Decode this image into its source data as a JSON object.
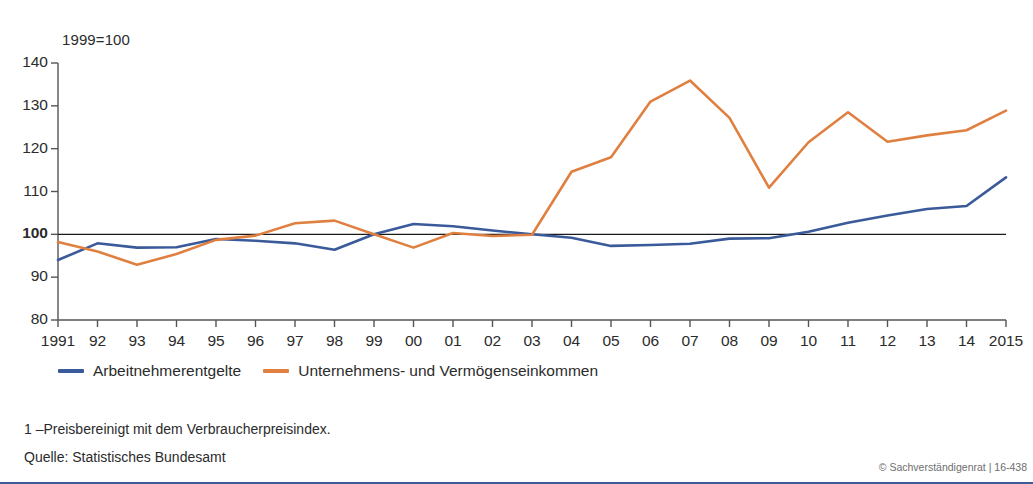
{
  "chart_data": {
    "type": "line",
    "title": "",
    "subtitle": "",
    "axis_unit_label": "1999=100",
    "xlabel": "",
    "ylabel": "",
    "grid": false,
    "legend_position": "bottom-left",
    "xlim": [
      1991,
      2015
    ],
    "ylim": [
      80,
      140
    ],
    "ytick_values": [
      80,
      90,
      100,
      110,
      120,
      130,
      140
    ],
    "ytick_labels": [
      "80",
      "90",
      "100",
      "110",
      "120",
      "130",
      "140"
    ],
    "emphasized_ytick": "100",
    "x": [
      1991,
      1992,
      1993,
      1994,
      1995,
      1996,
      1997,
      1998,
      1999,
      2000,
      2001,
      2002,
      2003,
      2004,
      2005,
      2006,
      2007,
      2008,
      2009,
      2010,
      2011,
      2012,
      2013,
      2014,
      2015
    ],
    "categories": [
      "1991",
      "92",
      "93",
      "94",
      "95",
      "96",
      "97",
      "98",
      "99",
      "00",
      "01",
      "02",
      "03",
      "04",
      "05",
      "06",
      "07",
      "08",
      "09",
      "10",
      "11",
      "12",
      "13",
      "14",
      "2015"
    ],
    "series": [
      {
        "name": "Arbeitnehmerentgelte",
        "color": "#3a5a9a",
        "values": [
          94.0,
          97.9,
          96.9,
          97.0,
          98.9,
          98.5,
          97.9,
          96.4,
          100.0,
          102.4,
          101.9,
          100.9,
          100.0,
          99.2,
          97.3,
          97.5,
          97.8,
          99.0,
          99.1,
          100.6,
          102.7,
          104.4,
          105.9,
          106.6,
          113.3
        ]
      },
      {
        "name": "Unternehmens- und Vermögenseinkommen",
        "color": "#e08040",
        "values": [
          98.2,
          96.0,
          92.9,
          95.4,
          98.7,
          99.7,
          102.6,
          103.2,
          100.0,
          96.9,
          100.3,
          99.6,
          99.9,
          114.6,
          118.0,
          131.0,
          135.9,
          127.2,
          110.9,
          121.5,
          128.5,
          121.6,
          123.1,
          124.3,
          128.9
        ]
      }
    ]
  },
  "legend": {
    "items": [
      {
        "label": "Arbeitnehmerentgelte",
        "color": "#3a5a9a"
      },
      {
        "label": "Unternehmens- und Vermögenseinkommen",
        "color": "#e08040"
      }
    ]
  },
  "notes": {
    "footnote_1": "1 –Preisbereinigt mit dem Verbraucherpreisindex.",
    "source": "Quelle: Statistisches Bundesamt",
    "copyright": "© Sachverständigenrat | 16-438"
  }
}
